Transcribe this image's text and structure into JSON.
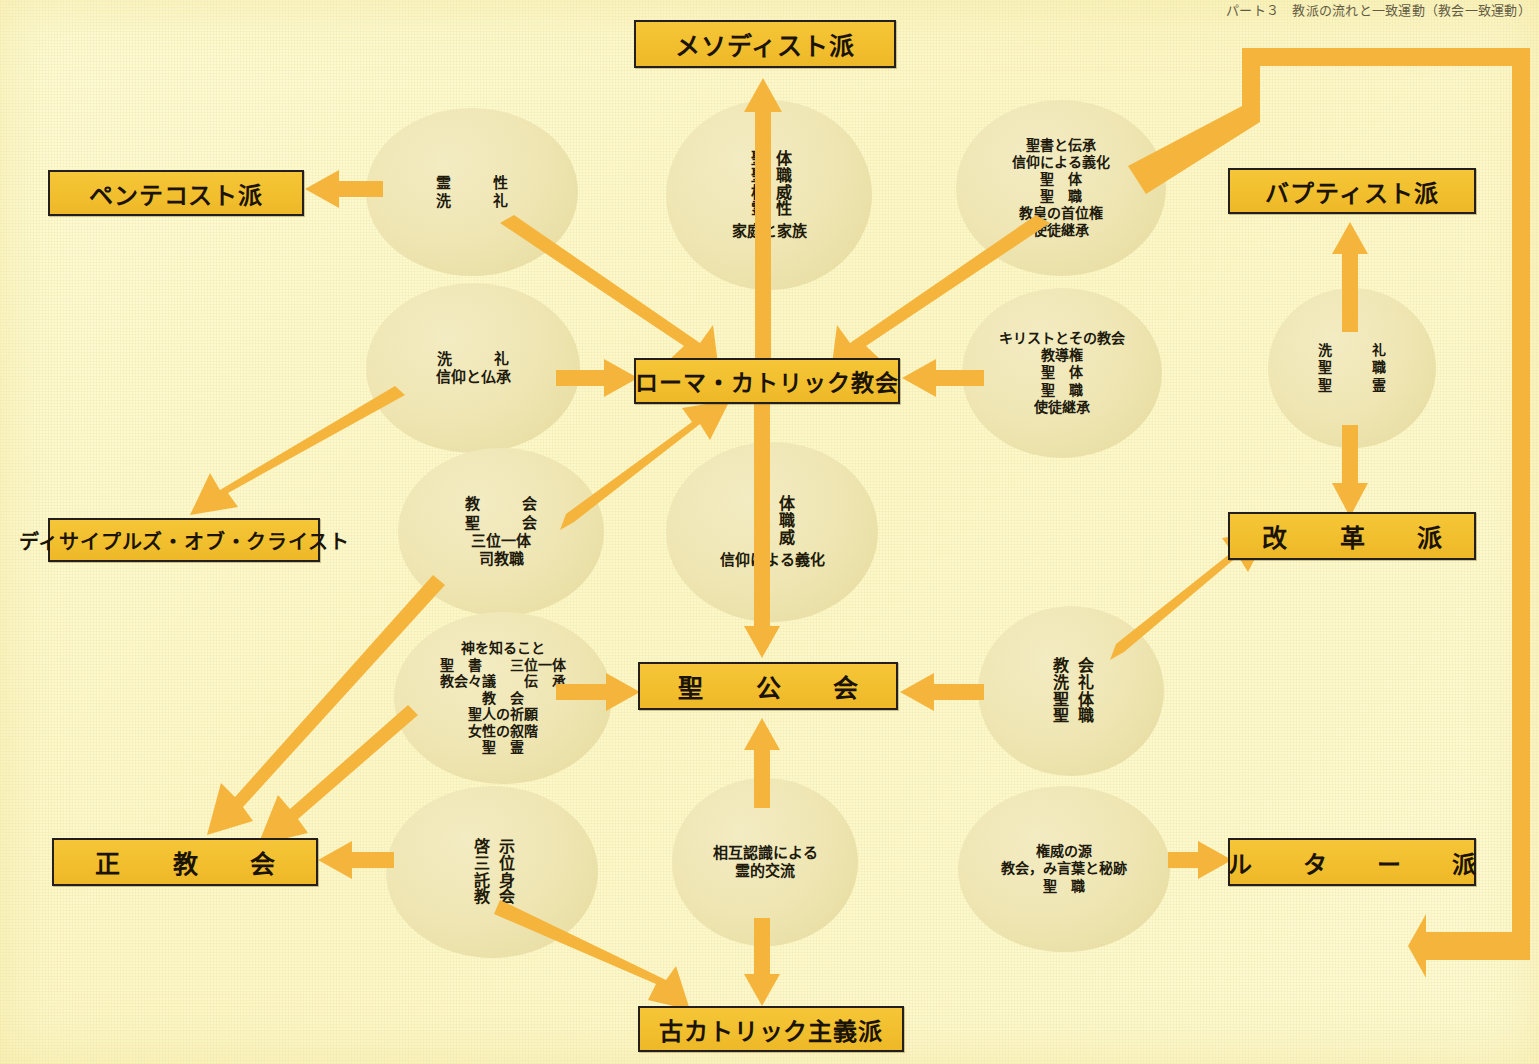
{
  "page": {
    "corner_note": "パート３　教派の流れと一致運動（教会一致運動）",
    "accent_box": "#f2c02f",
    "accent_arrow": "#f5b53c",
    "ellipse_fill": "#eee5b2",
    "background": "#fdfbd5",
    "border": "#231f20"
  },
  "boxes": {
    "methodist": "メソディスト派",
    "pentecostal": "ペンテコスト派",
    "baptist": "バプティスト派",
    "disciples": "ディサイプルズ・オブ・クライスト",
    "reformed": "改　革　派",
    "roman_catholic": "ローマ・カトリック教会",
    "anglican": "聖　公　会",
    "orthodox": "正　教　会",
    "lutheran": "ル　タ　ー　派",
    "old_catholic": "古カトリック主義派"
  },
  "ellipses": {
    "spirituality_baptism": {
      "lines": [
        "霊　性",
        "洗　礼"
      ]
    },
    "sacrament_family": {
      "vertical_right": "体職威性",
      "vertical_left": "聖聖権霊",
      "below": "家庭と家族",
      "readings": [
        "聖体",
        "聖職",
        "権威",
        "霊性",
        "家庭と家族"
      ]
    },
    "scripture_tradition": {
      "lines": [
        "聖書と伝承",
        "信仰による義化",
        "聖　体",
        "聖　職",
        "教皇の首位権",
        "使徒継承"
      ]
    },
    "baptism_faith": {
      "lines": [
        "洗　礼",
        "信仰と仏承"
      ]
    },
    "christ_church": {
      "lines": [
        "キリストとその教会",
        "教導権",
        "聖　体",
        "聖　職",
        "使徒継承"
      ]
    },
    "baptist_ellipse": {
      "vertical_right": "洗職",
      "vertical_left": "礼聖",
      "readings": [
        "洗　礼",
        "聖職",
        "聖霊"
      ],
      "lines": [
        "洗　礼",
        "聖　職",
        "聖　霊"
      ]
    },
    "church_trinity": {
      "lines": [
        "教　会",
        "聖　会",
        "三位一体",
        "司教職"
      ]
    },
    "eucharist_justification": {
      "vertical_right": "体職威",
      "vertical_left": "聖聖権",
      "below": "信仰による義化",
      "readings": [
        "聖体",
        "聖職",
        "権威",
        "信仰による義化"
      ]
    },
    "knowing_god": {
      "lines": [
        "神を知ること",
        "聖　書　　三位一体",
        "教会々議　　伝　承",
        "教　会",
        "聖人の祈願",
        "女性の叙階",
        "聖　霊"
      ]
    },
    "church_baptism_reformed": {
      "vertical_right": "会礼体職",
      "vertical_left": "教洗聖聖",
      "readings": [
        "教会",
        "洗礼",
        "聖体",
        "聖職"
      ]
    },
    "revelation_incarnation": {
      "vertical_right": "示位身会",
      "vertical_left": "啓三託教",
      "readings": [
        "啓示",
        "三位",
        "託身",
        "教会"
      ]
    },
    "mutual_recognition": {
      "lines": [
        "相互認識による",
        "霊的交流"
      ]
    },
    "authority_source": {
      "lines": [
        "権威の源",
        "教会，み言葉と秘跡",
        "聖　職"
      ]
    }
  }
}
